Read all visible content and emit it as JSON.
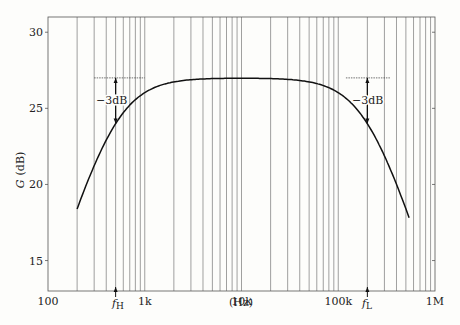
{
  "chart_data": {
    "type": "line",
    "title": "",
    "xlabel": "(Hz)",
    "ylabel": "G (dB)",
    "xscale": "log",
    "xlim": [
      100,
      1000000
    ],
    "ylim": [
      13,
      31
    ],
    "grid": "vertical log minor+major",
    "x_tick_labels": [
      {
        "value": 100,
        "label": "100"
      },
      {
        "value": 1000,
        "label": "1k"
      },
      {
        "value": 10000,
        "label": "10k"
      },
      {
        "value": 100000,
        "label": "100k"
      },
      {
        "value": 1000000,
        "label": "1M"
      }
    ],
    "y_ticks": [
      15,
      20,
      25,
      30
    ],
    "y_tick_labels": [
      "15",
      "20",
      "25",
      "30"
    ],
    "series": [
      {
        "name": "Gain",
        "midband_gain_db": 27,
        "x": [
          200,
          300,
          400,
          500,
          700,
          1000,
          2000,
          5000,
          10000,
          20000,
          50000,
          100000,
          150000,
          200000,
          300000,
          400000,
          540000
        ],
        "y": [
          18.4,
          21.3,
          23.0,
          24.0,
          25.3,
          26.0,
          26.7,
          27.0,
          27.0,
          27.0,
          26.7,
          26.0,
          25.1,
          24.0,
          21.9,
          20.0,
          17.9
        ]
      }
    ],
    "annotations": [
      {
        "text": "-3dB",
        "x": 500,
        "y_from": 27,
        "y_to": 24,
        "type": "double-arrow"
      },
      {
        "text": "-3dB",
        "x": 200000,
        "y_from": 27,
        "y_to": 24,
        "type": "double-arrow"
      },
      {
        "text": "f_H",
        "x": 500,
        "type": "axis-marker"
      },
      {
        "text": "f_L",
        "x": 200000,
        "type": "axis-marker"
      }
    ]
  },
  "labels": {
    "ylabel_main": "G",
    "ylabel_unit": "(dB)",
    "xlabel": "(Hz)",
    "fH_main": "f",
    "fH_sub": "H",
    "fL_main": "f",
    "fL_sub": "L",
    "minus3db_left": "−3dB",
    "minus3db_right": "−3dB"
  }
}
